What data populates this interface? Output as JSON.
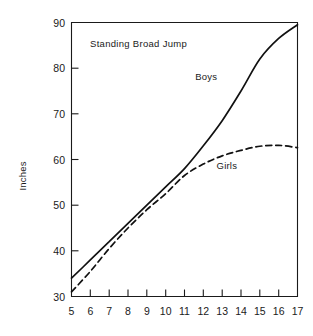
{
  "chart_data": {
    "type": "line",
    "title": "Standing Broad Jump",
    "xlabel": "",
    "ylabel": "Inches",
    "x": [
      5,
      6,
      7,
      8,
      9,
      10,
      11,
      12,
      13,
      14,
      15,
      16,
      17
    ],
    "xticklabels": [
      "5",
      "6",
      "7",
      "8",
      "9",
      "10",
      "11",
      "12",
      "13",
      "14",
      "15",
      "16",
      "17"
    ],
    "yticks": [
      30,
      40,
      50,
      60,
      70,
      80,
      90
    ],
    "yticklabels": [
      "30",
      "40",
      "50",
      "60",
      "70",
      "80",
      "90"
    ],
    "xlim": [
      5,
      17
    ],
    "ylim": [
      30,
      90
    ],
    "grid": false,
    "legend": "inline-annotations",
    "series": [
      {
        "name": "Boys",
        "style": "solid",
        "color": "#111111",
        "values": [
          34.0,
          38.0,
          42.0,
          46.0,
          50.0,
          54.0,
          58.0,
          63.0,
          68.5,
          75.0,
          82.0,
          86.5,
          89.5
        ]
      },
      {
        "name": "Girls",
        "style": "dashed",
        "color": "#111111",
        "values": [
          31.0,
          35.5,
          40.5,
          45.0,
          49.0,
          52.5,
          56.5,
          59.0,
          60.8,
          62.0,
          62.9,
          63.1,
          62.6
        ]
      }
    ],
    "annotations": [
      {
        "text": "Boys",
        "x": 12.15,
        "y": 77.5
      },
      {
        "text": "Girls",
        "x": 13.25,
        "y": 58.0
      },
      {
        "text": "Standing Broad Jump",
        "x": 6.05,
        "y": 85.4
      }
    ]
  }
}
